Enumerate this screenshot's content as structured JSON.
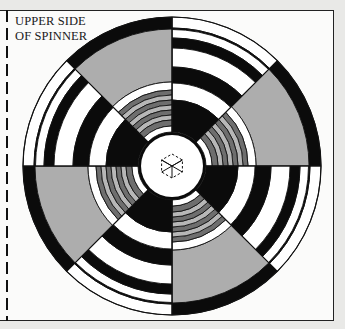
{
  "label": {
    "line1": "UPPER SIDE",
    "line2": "OF SPINNER"
  },
  "spinner": {
    "center": [
      172,
      166
    ],
    "outer_radius": 149,
    "sectors": 8,
    "sector_pattern": [
      "stripes",
      "grey",
      "stripes",
      "grey",
      "stripes",
      "grey",
      "stripes",
      "grey"
    ],
    "center_icon": "dashed-hexagon-icon"
  },
  "colors": {
    "black": "#0b0b0b",
    "white": "#ffffff",
    "light_grey": "#b7b7b7",
    "grey_fill": "#adadad",
    "dark_grey": "#6e6e6e",
    "background": "#fbfbfa",
    "outside": "#e9e9e7"
  }
}
